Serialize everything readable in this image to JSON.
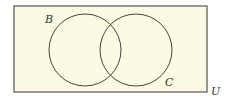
{
  "diagram": {
    "type": "venn",
    "universe": {
      "label": "U",
      "x": 14,
      "y": 6,
      "width": 193,
      "height": 86,
      "fill": "#fcfae2",
      "stroke": "#555555"
    },
    "sets": [
      {
        "label": "B",
        "cx": 85,
        "cy": 50,
        "r": 36,
        "label_x": 45,
        "label_y": 23
      },
      {
        "label": "C",
        "cx": 136,
        "cy": 50,
        "r": 36,
        "label_x": 165,
        "label_y": 86
      }
    ],
    "universe_label_pos": {
      "x": 211,
      "y": 95
    },
    "stroke_color": "#444444"
  }
}
